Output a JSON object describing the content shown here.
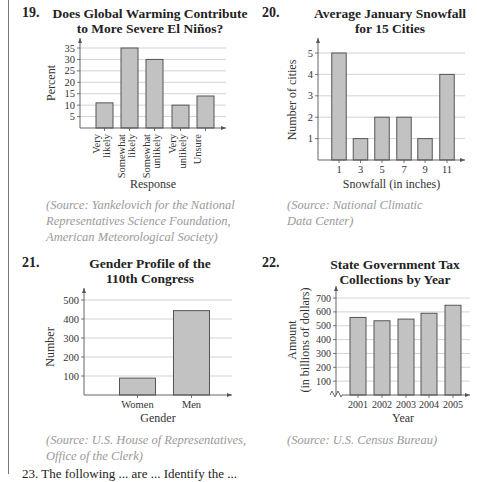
{
  "problems": [
    {
      "number": "19.",
      "title_line1": "Does Global Warming Contribute",
      "title_line2": "to More Severe El Niños?",
      "source_lines": [
        "(Source: Yankelovich for the National",
        "Representatives Science Foundation,",
        "American Meteorological Society)"
      ]
    },
    {
      "number": "20.",
      "title_line1": "Average January Snowfall",
      "title_line2": "for 15 Cities",
      "source_lines": [
        "(Source: National Climatic",
        "Data Center)"
      ]
    },
    {
      "number": "21.",
      "title_line1": "Gender Profile of the",
      "title_line2": "110th Congress",
      "source_lines": [
        "(Source: U.S. House of Representatives,",
        "Office of the Clerk)"
      ]
    },
    {
      "number": "22.",
      "title_line1": "State Government Tax",
      "title_line2": "Collections by Year",
      "source_lines": [
        "(Source: U.S. Census Bureau)"
      ]
    }
  ],
  "bottom_text": "23.  The following ... are ... Identify the ...",
  "colors": {
    "bar_fill": "#c2c2c2",
    "bar_stroke": "#555555",
    "grid": "#c8c8c8",
    "axis": "#555555",
    "source_text": "#9a9a9a"
  },
  "chart_data": [
    {
      "type": "bar",
      "title": "Does Global Warming Contribute to More Severe El Niños?",
      "categories": [
        "Very likely",
        "Somewhat likely",
        "Somewhat unlikely",
        "Very unlikely",
        "Unsure"
      ],
      "values": [
        11,
        35,
        30,
        10,
        14
      ],
      "xlabel": "Response",
      "ylabel": "Percent",
      "yticks": [
        5,
        10,
        15,
        20,
        25,
        30,
        35
      ],
      "ylim": [
        0,
        37
      ],
      "grid": true
    },
    {
      "type": "bar",
      "title": "Average January Snowfall for 15 Cities",
      "categories": [
        "1",
        "3",
        "5",
        "7",
        "9",
        "11"
      ],
      "values": [
        5,
        1,
        2,
        2,
        1,
        4
      ],
      "xlabel": "Snowfall (in inches)",
      "ylabel": "Number of cities",
      "yticks": [
        1,
        2,
        3,
        4,
        5
      ],
      "ylim": [
        0,
        5.5
      ],
      "grid": true
    },
    {
      "type": "bar",
      "title": "Gender Profile of the 110th Congress",
      "categories": [
        "Women",
        "Men"
      ],
      "values": [
        89,
        444
      ],
      "xlabel": "Gender",
      "ylabel": "Number",
      "yticks": [
        100,
        200,
        300,
        400,
        500
      ],
      "ylim": [
        0,
        520
      ],
      "grid": true
    },
    {
      "type": "bar",
      "title": "State Government Tax Collections by Year",
      "categories": [
        "2001",
        "2002",
        "2003",
        "2004",
        "2005"
      ],
      "values": [
        560,
        536,
        548,
        590,
        648
      ],
      "xlabel": "Year",
      "ylabel": "Amount (in billions of dollars)",
      "yticks": [
        100,
        200,
        300,
        400,
        500,
        600,
        700
      ],
      "ylim": [
        0,
        730
      ],
      "grid": true,
      "axis_break": true
    }
  ]
}
